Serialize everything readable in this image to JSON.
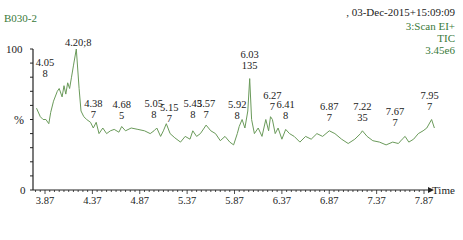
{
  "header": {
    "sample_id": "B030-2",
    "datetime": ", 03-Dec-2015+15:09:09",
    "scan_function": "3:Scan EI+",
    "trace_type": "TIC",
    "intensity": "3.45e6"
  },
  "colors": {
    "trace": "#6a9a5a",
    "header_text": "#3a7a3a",
    "axis": "#222222"
  },
  "axis": {
    "y_top": "100",
    "y_unit": "%",
    "y_bottom": "0",
    "x_label": "Time"
  },
  "chart_data": {
    "type": "line",
    "xlabel": "Time",
    "ylabel": "%",
    "xlim": [
      3.75,
      8.0
    ],
    "ylim": [
      0,
      100
    ],
    "x_ticks": [
      "3.87",
      "4.37",
      "4.87",
      "5.37",
      "5.87",
      "6.37",
      "6.87",
      "7.37",
      "7.87"
    ],
    "y_ticks": [
      "0",
      "100"
    ],
    "grid": false,
    "legend": null,
    "annotations": [
      {
        "rt": "4.05",
        "scan": "8",
        "x": 4.05,
        "y": 70
      },
      {
        "rt": "4.20;8",
        "scan": "",
        "x": 4.2,
        "y": 100
      },
      {
        "rt": "4.38",
        "scan": "7",
        "x": 4.38,
        "y": 44
      },
      {
        "rt": "4.68",
        "scan": "5",
        "x": 4.68,
        "y": 45
      },
      {
        "rt": "5.05",
        "scan": "8",
        "x": 5.05,
        "y": 44
      },
      {
        "rt": "5.15",
        "scan": "7",
        "x": 5.15,
        "y": 44
      },
      {
        "rt": "5.43",
        "scan": "8",
        "x": 5.43,
        "y": 42
      },
      {
        "rt": "5.57",
        "scan": "7",
        "x": 5.57,
        "y": 44
      },
      {
        "rt": "5.92",
        "scan": "8",
        "x": 5.92,
        "y": 45
      },
      {
        "rt": "6.03",
        "scan": "135",
        "x": 6.03,
        "y": 79
      },
      {
        "rt": "6.27",
        "scan": "7",
        "x": 6.27,
        "y": 50
      },
      {
        "rt": "6.41",
        "scan": "8",
        "x": 6.41,
        "y": 43
      },
      {
        "rt": "6.87",
        "scan": "7",
        "x": 6.87,
        "y": 42
      },
      {
        "rt": "7.22",
        "scan": "35",
        "x": 7.22,
        "y": 42
      },
      {
        "rt": "7.67",
        "scan": "7",
        "x": 7.67,
        "y": 38
      },
      {
        "rt": "7.95",
        "scan": "7",
        "x": 7.95,
        "y": 50
      }
    ],
    "series": [
      {
        "name": "TIC",
        "x": [
          3.78,
          3.82,
          3.85,
          3.88,
          3.91,
          3.93,
          3.96,
          4.0,
          4.02,
          4.05,
          4.07,
          4.09,
          4.11,
          4.13,
          4.15,
          4.17,
          4.2,
          4.23,
          4.25,
          4.28,
          4.31,
          4.35,
          4.38,
          4.41,
          4.44,
          4.48,
          4.52,
          4.56,
          4.6,
          4.65,
          4.68,
          4.72,
          4.78,
          4.85,
          4.92,
          4.98,
          5.02,
          5.05,
          5.09,
          5.12,
          5.15,
          5.19,
          5.24,
          5.3,
          5.35,
          5.4,
          5.43,
          5.47,
          5.51,
          5.55,
          5.57,
          5.62,
          5.67,
          5.72,
          5.77,
          5.82,
          5.86,
          5.9,
          5.92,
          5.95,
          5.98,
          6.01,
          6.03,
          6.05,
          6.08,
          6.12,
          6.16,
          6.2,
          6.23,
          6.25,
          6.27,
          6.3,
          6.33,
          6.37,
          6.41,
          6.45,
          6.5,
          6.56,
          6.62,
          6.68,
          6.74,
          6.8,
          6.87,
          6.93,
          7.0,
          7.07,
          7.14,
          7.2,
          7.22,
          7.27,
          7.33,
          7.4,
          7.47,
          7.54,
          7.6,
          7.64,
          7.67,
          7.71,
          7.76,
          7.81,
          7.86,
          7.9,
          7.95,
          7.98
        ],
        "y": [
          58,
          52,
          50,
          50,
          47,
          55,
          63,
          70,
          72,
          66,
          74,
          68,
          76,
          72,
          80,
          88,
          100,
          72,
          56,
          52,
          50,
          48,
          44,
          48,
          40,
          44,
          40,
          42,
          43,
          41,
          45,
          42,
          44,
          43,
          42,
          40,
          42,
          44,
          38,
          42,
          47,
          40,
          37,
          34,
          38,
          36,
          42,
          38,
          40,
          44,
          46,
          42,
          40,
          35,
          38,
          34,
          32,
          40,
          45,
          50,
          44,
          56,
          79,
          50,
          40,
          44,
          38,
          50,
          42,
          52,
          50,
          40,
          44,
          36,
          43,
          40,
          38,
          34,
          38,
          36,
          40,
          38,
          42,
          40,
          36,
          33,
          36,
          40,
          42,
          38,
          35,
          34,
          32,
          34,
          33,
          36,
          38,
          34,
          36,
          40,
          42,
          44,
          50,
          44
        ]
      }
    ]
  }
}
